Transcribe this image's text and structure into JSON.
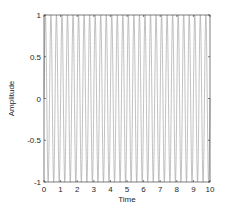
{
  "chart_data": {
    "type": "line",
    "title": "",
    "xlabel": "Time",
    "ylabel": "Amplitude",
    "xlim": [
      0,
      10
    ],
    "ylim": [
      -1,
      1
    ],
    "xticks": [
      0,
      1,
      2,
      3,
      4,
      5,
      6,
      7,
      8,
      9,
      10
    ],
    "xtick_labels": [
      "0",
      "1",
      "2",
      "3",
      "4",
      "5",
      "6",
      "7",
      "8",
      "9",
      "10"
    ],
    "yticks": [
      -1,
      -0.5,
      0,
      0.5,
      1
    ],
    "ytick_labels": [
      "-1",
      "-0.5",
      "0",
      "0.5",
      "1"
    ],
    "grid": false,
    "legend": null,
    "series": [
      {
        "name": "signal",
        "function": "sin(2*pi*3*t)",
        "frequency_hz": 3,
        "amplitude": 1,
        "t_start": 0,
        "t_end": 10,
        "color": "#a6a6a6"
      }
    ]
  },
  "colors": {
    "axis": "#262626",
    "line": "#a6a6a6",
    "background": "#ffffff"
  }
}
